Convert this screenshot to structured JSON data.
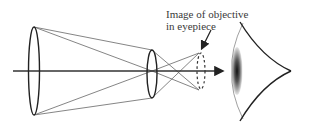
{
  "diagram": {
    "annotation": {
      "line1": "Image of objective",
      "line2": "in eyepiece"
    },
    "elements": {
      "objective_lens": "objective-lens",
      "eyepiece_lens": "eyepiece-lens",
      "exit_pupil_image": "image of objective (dashed)",
      "eye": "eye",
      "optical_axis": "optical axis"
    },
    "colors": {
      "line": "#333333",
      "ray": "#555555",
      "text": "#3a3a3a",
      "background": "#ffffff"
    }
  }
}
